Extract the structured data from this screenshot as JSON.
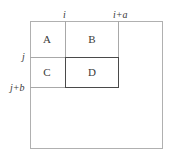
{
  "diagram": {
    "cells": [
      {
        "id": "A",
        "label": "A"
      },
      {
        "id": "B",
        "label": "B"
      },
      {
        "id": "C",
        "label": "C"
      },
      {
        "id": "D",
        "label": "D",
        "highlighted": true
      }
    ],
    "column_markers": [
      {
        "label": "i"
      },
      {
        "label": "i+a"
      }
    ],
    "row_markers": [
      {
        "label": "j"
      },
      {
        "label": "j+b"
      }
    ],
    "colors": {
      "grid_line": "#a8a8a8",
      "highlight_border": "#4a4a4a",
      "text": "#3a3a3a",
      "background": "#ffffff"
    }
  }
}
